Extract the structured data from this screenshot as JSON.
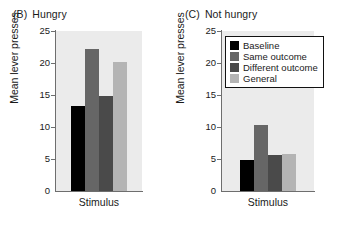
{
  "chart_data": [
    {
      "type": "bar",
      "id": "panel-b",
      "panel_tag": "(B)",
      "title": "Hungry",
      "xlabel": "Stimulus",
      "ylabel": "Mean lever presses",
      "categories": [
        "Baseline",
        "Same outcome",
        "Different outcome",
        "General"
      ],
      "values": [
        13.3,
        22.2,
        14.8,
        20.2
      ],
      "ylim": [
        0,
        25
      ],
      "yticks": [
        0,
        5,
        10,
        15,
        20,
        25
      ],
      "grid": false,
      "legend": false
    },
    {
      "type": "bar",
      "id": "panel-c",
      "panel_tag": "(C)",
      "title": "Not hungry",
      "xlabel": "Stimulus",
      "ylabel": "Mean lever presses",
      "categories": [
        "Baseline",
        "Same outcome",
        "Different outcome",
        "General"
      ],
      "values": [
        4.9,
        10.3,
        5.6,
        5.8
      ],
      "ylim": [
        0,
        25
      ],
      "yticks": [
        0,
        5,
        10,
        15,
        20,
        25
      ],
      "grid": false,
      "legend": true,
      "legend_position": "top-right"
    }
  ],
  "legend": {
    "entries": [
      {
        "label": "Baseline",
        "color": "#000000"
      },
      {
        "label": "Same outcome",
        "color": "#666666"
      },
      {
        "label": "Different outcome",
        "color": "#4a4a4a"
      },
      {
        "label": "General",
        "color": "#b4b4b4"
      }
    ]
  },
  "colors": {
    "plot_background": "#ebebeb",
    "axis": "#6e6e6e",
    "text": "#1a1a1a",
    "series": [
      "#000000",
      "#666666",
      "#4a4a4a",
      "#b4b4b4"
    ]
  }
}
